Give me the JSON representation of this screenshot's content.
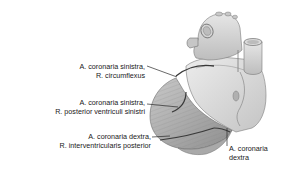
{
  "figure": {
    "colors": {
      "background": "#ffffff",
      "heart_light": "#dcdcdc",
      "heart_mid": "#b8b8b8",
      "heart_dark": "#8a8a8a",
      "vessel_line": "#3a3a3a",
      "text": "#1a1a1a"
    }
  },
  "labels": [
    {
      "line1": "A. coronaria sinistra,",
      "line2": "R. circumflexus"
    },
    {
      "line1": "A. coronaria sinistra,",
      "line2": "R. posterior ventriculi sinistri"
    },
    {
      "line1": "A. coronaria dextra,",
      "line2": "R. interventricularis posterior"
    },
    {
      "line1": "A. coronaria",
      "line2": "dextra"
    }
  ]
}
